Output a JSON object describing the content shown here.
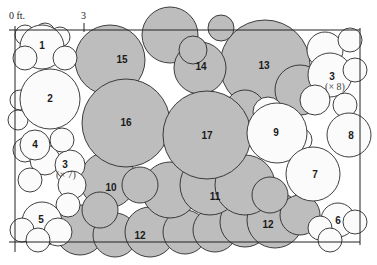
{
  "diagram": {
    "scale": {
      "origin_label": "0 ft.",
      "tick_label": "3"
    },
    "colors": {
      "shaded": "#bdbdbd",
      "unshaded": "#fbfbfb",
      "line": "#2a2a2a"
    },
    "plants": [
      {
        "id": "1",
        "label": "1",
        "shaded": false
      },
      {
        "id": "2",
        "label": "2",
        "shaded": false
      },
      {
        "id": "3a",
        "label": "3",
        "count": "(× 8)",
        "shaded": false
      },
      {
        "id": "3b",
        "label": "3",
        "count": "(× 7)",
        "shaded": false
      },
      {
        "id": "4",
        "label": "4",
        "shaded": false
      },
      {
        "id": "5",
        "label": "5",
        "shaded": false
      },
      {
        "id": "6",
        "label": "6",
        "shaded": false
      },
      {
        "id": "7",
        "label": "7",
        "shaded": false
      },
      {
        "id": "8",
        "label": "8",
        "shaded": false
      },
      {
        "id": "9",
        "label": "9",
        "shaded": false
      },
      {
        "id": "10",
        "label": "10",
        "shaded": true
      },
      {
        "id": "11",
        "label": "11",
        "shaded": true
      },
      {
        "id": "12a",
        "label": "12",
        "shaded": true
      },
      {
        "id": "12b",
        "label": "12",
        "shaded": true
      },
      {
        "id": "13",
        "label": "13",
        "shaded": true
      },
      {
        "id": "14",
        "label": "14",
        "shaded": true
      },
      {
        "id": "15",
        "label": "15",
        "shaded": true
      },
      {
        "id": "16",
        "label": "16",
        "shaded": true
      },
      {
        "id": "17",
        "label": "17",
        "shaded": true
      }
    ]
  }
}
